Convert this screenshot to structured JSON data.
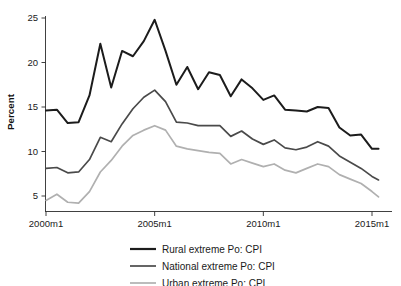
{
  "figure": {
    "title_fragment": "",
    "axis_label_y": "Percent"
  },
  "axes": {
    "y_ticks": [
      "5",
      "10",
      "15",
      "20",
      "25"
    ],
    "x_ticks": [
      "2000m1",
      "2005m1",
      "2010m1",
      "2015m1"
    ]
  },
  "legend": {
    "items": [
      {
        "label": "Rural extreme Po: CPI",
        "color": "#1c1c1c"
      },
      {
        "label": "National extreme Po: CPI",
        "color": "#4a4a4a"
      },
      {
        "label": "Urban extreme Po: CPI",
        "color": "#b0b0b0"
      }
    ]
  },
  "chart_data": {
    "type": "line",
    "title": "",
    "subtitle": "",
    "xlabel": "",
    "ylabel": "Percent",
    "xlim": [
      2000,
      2015.5
    ],
    "ylim": [
      3.2,
      25.8
    ],
    "yticks": [
      5,
      10,
      15,
      20,
      25
    ],
    "xticks": [
      2000,
      2005,
      2010,
      2015
    ],
    "xtick_labels": [
      "2000m1",
      "2005m1",
      "2010m1",
      "2015m1"
    ],
    "grid": false,
    "legend_position": "below-axes",
    "x": [
      2000.0,
      2000.5,
      2001.0,
      2001.5,
      2002.0,
      2002.5,
      2003.0,
      2003.5,
      2004.0,
      2004.5,
      2005.0,
      2005.5,
      2006.0,
      2006.5,
      2007.0,
      2007.5,
      2008.0,
      2008.5,
      2009.0,
      2009.5,
      2010.0,
      2010.5,
      2011.0,
      2011.5,
      2012.0,
      2012.5,
      2013.0,
      2013.5,
      2014.0,
      2014.5,
      2015.0,
      2015.3
    ],
    "series": [
      {
        "name": "Rural extreme Po: CPI",
        "color": "#1c1c1c",
        "width": 2.0,
        "values": [
          14.6,
          14.7,
          13.2,
          13.3,
          16.3,
          22.1,
          17.2,
          21.3,
          20.7,
          22.4,
          24.8,
          21.3,
          17.5,
          19.5,
          17.0,
          18.9,
          18.6,
          16.2,
          18.1,
          17.1,
          15.8,
          16.3,
          14.7,
          14.6,
          14.5,
          15.0,
          14.9,
          12.7,
          11.8,
          11.9,
          10.3,
          10.3
        ]
      },
      {
        "name": "National extreme Po: CPI",
        "color": "#4a4a4a",
        "width": 1.7,
        "values": [
          8.1,
          8.2,
          7.6,
          7.7,
          9.1,
          11.6,
          11.1,
          13.1,
          14.8,
          16.1,
          16.9,
          15.6,
          13.3,
          13.2,
          12.9,
          12.9,
          12.9,
          11.7,
          12.3,
          11.4,
          10.8,
          11.3,
          10.4,
          10.2,
          10.5,
          11.1,
          10.6,
          9.5,
          8.8,
          8.1,
          7.2,
          6.8
        ]
      },
      {
        "name": "Urban extreme Po: CPI",
        "color": "#b0b0b0",
        "width": 1.7,
        "values": [
          4.5,
          5.2,
          4.3,
          4.2,
          5.5,
          7.7,
          9.0,
          10.6,
          11.8,
          12.4,
          12.9,
          12.4,
          10.6,
          10.3,
          10.1,
          9.9,
          9.8,
          8.6,
          9.1,
          8.7,
          8.3,
          8.6,
          7.9,
          7.6,
          8.1,
          8.6,
          8.3,
          7.4,
          6.9,
          6.4,
          5.5,
          4.9
        ]
      }
    ]
  }
}
